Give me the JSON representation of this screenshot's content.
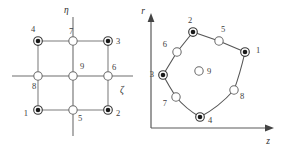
{
  "figure": {
    "caption": "",
    "panels": [
      {
        "id": "parent-element",
        "name": "parent-element-natural-coordinates",
        "axes": {
          "vertical_label": "η",
          "horizontal_label": "ζ"
        },
        "nodes": [
          {
            "id": "1",
            "label": "1",
            "type": "corner",
            "x": 38,
            "y": 110,
            "label_x": 28,
            "label_y": 114
          },
          {
            "id": "2",
            "label": "2",
            "type": "corner",
            "x": 108,
            "y": 110,
            "label_x": 117,
            "label_y": 114
          },
          {
            "id": "3",
            "label": "3",
            "type": "corner",
            "x": 108,
            "y": 41,
            "label_x": 117,
            "label_y": 42
          },
          {
            "id": "4",
            "label": "4",
            "type": "corner",
            "x": 38,
            "y": 41,
            "label_x": 31,
            "label_y": 31
          },
          {
            "id": "5",
            "label": "5",
            "type": "mid",
            "x": 73,
            "y": 110,
            "label_x": 77,
            "label_y": 118
          },
          {
            "id": "6",
            "label": "6",
            "type": "mid",
            "x": 108,
            "y": 76,
            "label_x": 112,
            "label_y": 69
          },
          {
            "id": "7",
            "label": "7",
            "type": "mid",
            "x": 73,
            "y": 41,
            "label_x": 70,
            "label_y": 32
          },
          {
            "id": "8",
            "label": "8",
            "type": "mid",
            "x": 38,
            "y": 76,
            "label_x": 33,
            "label_y": 86
          },
          {
            "id": "9",
            "label": "9",
            "type": "center",
            "x": 73,
            "y": 76,
            "label_x": 80,
            "label_y": 68
          }
        ]
      },
      {
        "id": "mapped-element",
        "name": "mapped-element-physical-coordinates",
        "axes": {
          "vertical_label": "r",
          "horizontal_label": "z"
        },
        "nodes": [
          {
            "id": "1",
            "label": "1",
            "type": "corner",
            "x": 245,
            "y": 52,
            "label_x": 256,
            "label_y": 51
          },
          {
            "id": "2",
            "label": "2",
            "type": "corner",
            "x": 193,
            "y": 32,
            "label_x": 190,
            "label_y": 22
          },
          {
            "id": "3",
            "label": "3",
            "type": "corner",
            "x": 163,
            "y": 75,
            "label_x": 153,
            "label_y": 75
          },
          {
            "id": "4",
            "label": "4",
            "type": "corner",
            "x": 200,
            "y": 117,
            "label_x": 209,
            "label_y": 120
          },
          {
            "id": "5",
            "label": "5",
            "type": "mid",
            "x": 219,
            "y": 41,
            "label_x": 223,
            "label_y": 31
          },
          {
            "id": "6",
            "label": "6",
            "type": "mid",
            "x": 177,
            "y": 52,
            "label_x": 166,
            "label_y": 47
          },
          {
            "id": "7",
            "label": "7",
            "type": "mid",
            "x": 176,
            "y": 97,
            "label_x": 164,
            "label_y": 102
          },
          {
            "id": "8",
            "label": "8",
            "type": "mid",
            "x": 234,
            "y": 90,
            "label_x": 241,
            "label_y": 96
          },
          {
            "id": "9",
            "label": "9",
            "type": "center",
            "x": 199,
            "y": 71,
            "label_x": 207,
            "label_y": 72
          }
        ]
      }
    ]
  },
  "colors": {
    "background": "#ffffff",
    "line": "#7d7d7d",
    "axis": "#6e6e6e",
    "node_fill": "#ffffff",
    "node_stroke": "#3a3a3a",
    "node_core": "#1a1a1a",
    "label_text": "#3d3d3d"
  }
}
